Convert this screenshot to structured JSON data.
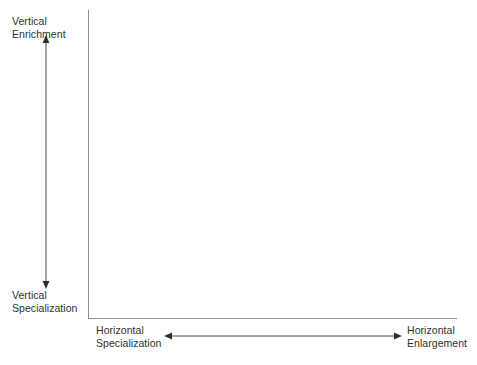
{
  "diagram": {
    "type": "two-axis-conceptual-framework",
    "title": "",
    "background_color": "#ffffff",
    "axis_color": "#8f8f8f",
    "text_color": "#2f2f2f",
    "arrow_color": "#3a3a3a",
    "axes": {
      "vertical": {
        "name": "vertical-axis",
        "top_label": "Vertical\nEnrichment",
        "bottom_label": "Vertical\nSpecialization",
        "arrow": "double-headed-vertical"
      },
      "horizontal": {
        "name": "horizontal-axis",
        "left_label": "Horizontal\nSpecialization",
        "right_label": "Horizontal\nEnlargement",
        "arrow": "double-headed-horizontal"
      }
    },
    "labels": {
      "vertical_enrichment": "Vertical\nEnrichment",
      "vertical_specialization": "Vertical\nSpecialization",
      "horizontal_specialization": "Horizontal\nSpecialization",
      "horizontal_enlargement": "Horizontal\nEnlargement"
    },
    "plot_area": {
      "content": "",
      "empty": true
    }
  }
}
